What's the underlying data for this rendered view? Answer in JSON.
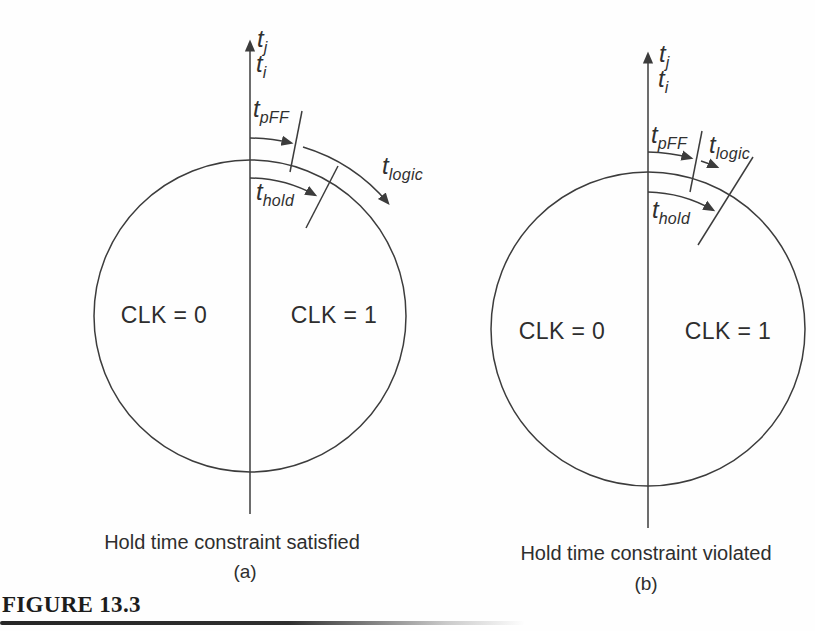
{
  "page": {
    "background": "#ffffff",
    "ink_color": "#3c3c3c",
    "text_color": "#2f2f2f"
  },
  "figure": {
    "label": "FIGURE 13.3"
  },
  "panels": [
    {
      "id": "a",
      "sub_label": "(a)",
      "caption": "Hold time constraint satisfied",
      "regions": {
        "left": "CLK = 0",
        "right": "CLK = 1"
      },
      "axis_labels": {
        "top": {
          "base": "t",
          "sub": "j"
        },
        "bottom": {
          "base": "t",
          "sub": "i"
        }
      },
      "arc_labels": {
        "pff": {
          "base": "t",
          "sub": "pFF"
        },
        "logic": {
          "base": "t",
          "sub": "logic"
        },
        "hold": {
          "base": "t",
          "sub": "hold"
        }
      }
    },
    {
      "id": "b",
      "sub_label": "(b)",
      "caption": "Hold time constraint violated",
      "regions": {
        "left": "CLK = 0",
        "right": "CLK = 1"
      },
      "axis_labels": {
        "top": {
          "base": "t",
          "sub": "j"
        },
        "bottom": {
          "base": "t",
          "sub": "i"
        }
      },
      "arc_labels": {
        "pff": {
          "base": "t",
          "sub": "pFF"
        },
        "logic": {
          "base": "t",
          "sub": "logic"
        },
        "hold": {
          "base": "t",
          "sub": "hold"
        }
      }
    }
  ]
}
